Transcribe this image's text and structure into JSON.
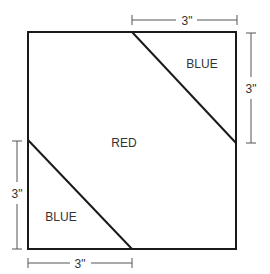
{
  "diagram": {
    "type": "quilt-block-layout",
    "square": {
      "x1": 28,
      "y1": 32,
      "x2": 236,
      "y2": 249
    },
    "cut_lines": [
      {
        "name": "upper-right-diagonal",
        "from": [
          132,
          32
        ],
        "to": [
          236,
          143
        ]
      },
      {
        "name": "lower-left-diagonal",
        "from": [
          28,
          140
        ],
        "to": [
          132,
          249
        ]
      }
    ],
    "regions": [
      {
        "name": "upper-right-triangle",
        "label": "BLUE"
      },
      {
        "name": "center",
        "label": "RED"
      },
      {
        "name": "lower-left-triangle",
        "label": "BLUE"
      }
    ],
    "dimensions": {
      "top": "3\"",
      "right": "3\"",
      "left": "3\"",
      "bottom": "3\""
    },
    "colors": {
      "stroke": "#1a1a1a",
      "dimension_stroke": "#555555",
      "text": "#333333"
    }
  }
}
